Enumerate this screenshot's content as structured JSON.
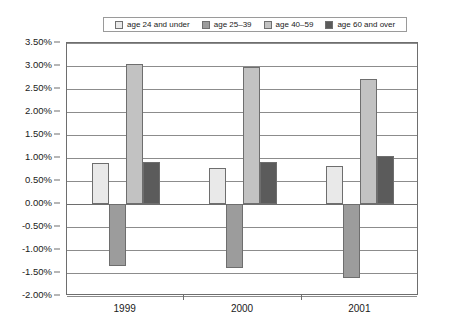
{
  "chart_data": {
    "type": "bar",
    "title": "",
    "subtitle": "",
    "xlabel": "",
    "ylabel": "",
    "categories": [
      "1999",
      "2000",
      "2001"
    ],
    "series": [
      {
        "name": "age 24 and under",
        "color": "#e9e9e9",
        "values": [
          0.9,
          0.78,
          0.82
        ]
      },
      {
        "name": "age 25–39",
        "color": "#9c9c9c",
        "values": [
          -1.35,
          -1.4,
          -1.6
        ]
      },
      {
        "name": "age 40–59",
        "color": "#c2c2c2",
        "values": [
          3.05,
          2.97,
          2.72
        ]
      },
      {
        "name": "age 60 and over",
        "color": "#5b5b5b",
        "values": [
          0.92,
          0.92,
          1.05
        ]
      }
    ],
    "ylim": [
      -2.0,
      3.5
    ],
    "ytick_step": 0.5,
    "ytick_labels": [
      "3.50%",
      "3.00%",
      "2.50%",
      "2.00%",
      "1.50%",
      "1.00%",
      "0.50%",
      "0.00%",
      "-0.50%",
      "-1.00%",
      "-1.50%",
      "-2.00%"
    ],
    "ytick_values": [
      3.5,
      3.0,
      2.5,
      2.0,
      1.5,
      1.0,
      0.5,
      0.0,
      -0.5,
      -1.0,
      -1.5,
      -2.0
    ],
    "value_suffix": "%",
    "grid": true,
    "legend_position": "top"
  },
  "legend": {
    "items": [
      {
        "label": "age 24 and under"
      },
      {
        "label": "age 25–39"
      },
      {
        "label": "age 40–59"
      },
      {
        "label": "age 60 and over"
      }
    ]
  },
  "colors": {
    "series1": "#e9e9e9",
    "series2": "#9c9c9c",
    "series3": "#c2c2c2",
    "series4": "#5b5b5b",
    "gridline": "#8c8c8c",
    "axis": "#6e6e6e",
    "text": "#1a1a1a",
    "background": "#ffffff"
  }
}
